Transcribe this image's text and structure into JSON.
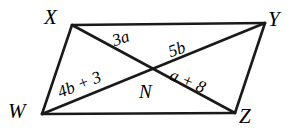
{
  "figure": {
    "type": "parallelogram-with-diagonals",
    "shape_name": "WXYZ",
    "stroke_color": "#1a1a1a",
    "background_color": "#ffffff",
    "vertices": [
      {
        "id": "X",
        "label": "X",
        "x": 72,
        "y": 25
      },
      {
        "id": "Y",
        "label": "Y",
        "x": 265,
        "y": 23
      },
      {
        "id": "Z",
        "label": "Z",
        "x": 235,
        "y": 113
      },
      {
        "id": "W",
        "label": "W",
        "x": 42,
        "y": 114
      }
    ],
    "intersection": {
      "id": "N",
      "label": "N",
      "x": 152,
      "y": 70
    },
    "edges": [
      {
        "id": "XY",
        "from": "X",
        "to": "Y"
      },
      {
        "id": "YZ",
        "from": "Y",
        "to": "Z"
      },
      {
        "id": "ZW",
        "from": "Z",
        "to": "W"
      },
      {
        "id": "WX",
        "from": "W",
        "to": "X"
      }
    ],
    "diagonals": [
      {
        "id": "XZ",
        "from": "X",
        "to": "Z"
      },
      {
        "id": "WY",
        "from": "W",
        "to": "Y"
      }
    ],
    "segment_labels": [
      {
        "id": "XN",
        "text": "3a",
        "on": "XZ",
        "side": "X-side"
      },
      {
        "id": "NY",
        "text": "5b",
        "on": "WY",
        "side": "Y-side"
      },
      {
        "id": "WN",
        "text": "4b + 3",
        "on": "WY",
        "side": "W-side"
      },
      {
        "id": "NZ",
        "text": "a + 8",
        "on": "XZ",
        "side": "Z-side"
      }
    ]
  }
}
